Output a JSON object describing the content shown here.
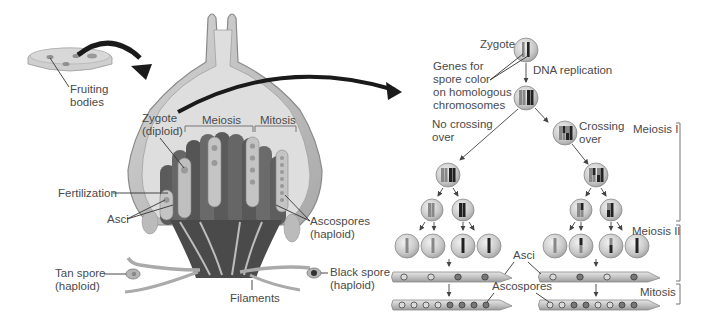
{
  "left_panel": {
    "labels": {
      "fruiting_bodies": [
        "Fruiting",
        "bodies"
      ],
      "zygote": [
        "Zygote",
        "(diploid)"
      ],
      "meiosis": "Meiosis",
      "mitosis": "Mitosis",
      "fertilization": "Fertilization",
      "asci": "Asci",
      "ascospores": [
        "Ascospores",
        "(haploid)"
      ],
      "tan_spore": [
        "Tan spore",
        "(haploid)"
      ],
      "black_spore": [
        "Black spore",
        "(haploid)"
      ],
      "filaments": "Filaments"
    }
  },
  "right_panel": {
    "labels": {
      "zygote": "Zygote",
      "genes": [
        "Genes for",
        "spore color",
        "on homologous",
        "chromosomes"
      ],
      "dna_replication": "DNA replication",
      "no_crossing": [
        "No crossing",
        "over"
      ],
      "crossing": [
        "Crossing",
        "over"
      ],
      "asci": "Asci",
      "ascospores": "Ascospores"
    },
    "stages": [
      {
        "label": "Meiosis I"
      },
      {
        "label": "Meiosis II"
      },
      {
        "label": "Mitosis"
      }
    ],
    "ascus_patterns": {
      "no_crossing_4": [
        "tan",
        "tan",
        "black",
        "black"
      ],
      "no_crossing_8": [
        "tan",
        "tan",
        "tan",
        "tan",
        "black",
        "black",
        "black",
        "black"
      ],
      "crossing_4": [
        "tan",
        "black",
        "tan",
        "black"
      ],
      "crossing_8": [
        "tan",
        "tan",
        "black",
        "black",
        "tan",
        "tan",
        "black",
        "black"
      ]
    }
  },
  "colors": {
    "background": "#ffffff",
    "text": "#4a4a4a",
    "arrow": "#1a1a1a",
    "cell": "#c8c8c8",
    "fruiting_body": "#bdbdbd"
  }
}
